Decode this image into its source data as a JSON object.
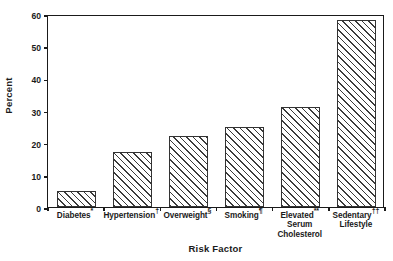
{
  "chart_data": {
    "type": "bar",
    "title": "",
    "subtitle": "",
    "xlabel": "Risk Factor",
    "ylabel": "Percent",
    "categories": [
      "Diabetes*",
      "Hypertension†",
      "Overweight§",
      "Smoking¶",
      "Elevated** Serum Cholesterol",
      "Sedentary†† Lifestyle"
    ],
    "values": [
      5,
      17,
      22,
      25,
      31,
      58
    ],
    "ylim": [
      0,
      60
    ],
    "yticks": [
      0,
      10,
      20,
      30,
      40,
      50,
      60
    ],
    "ytick_labels": [
      "0",
      "10",
      "20",
      "30",
      "40",
      "50",
      "60"
    ],
    "grid": false,
    "legend": null,
    "bar_fill": "hatched-diagonal",
    "colors": {
      "axis": "#1a1a1a",
      "bar_edge": "#333333",
      "bar_hatch": "#3b3b3b",
      "background": "#ffffff"
    }
  },
  "axis": {
    "y_title": "Percent",
    "x_title": "Risk Factor"
  },
  "categories_display": [
    {
      "line1": "Diabetes",
      "sup1": "*",
      "line2": "",
      "sup2": ""
    },
    {
      "line1": "Hypertension",
      "sup1": "†",
      "line2": "",
      "sup2": ""
    },
    {
      "line1": "Overweight",
      "sup1": "§",
      "line2": "",
      "sup2": ""
    },
    {
      "line1": "Smoking",
      "sup1": "¶",
      "line2": "",
      "sup2": ""
    },
    {
      "line1": "Elevated",
      "sup1": "**",
      "line2": "Serum",
      "line3": "Cholesterol",
      "sup2": ""
    },
    {
      "line1": "Sedentary",
      "sup1": "††",
      "line2": "Lifestyle",
      "line3": "",
      "sup2": ""
    }
  ]
}
